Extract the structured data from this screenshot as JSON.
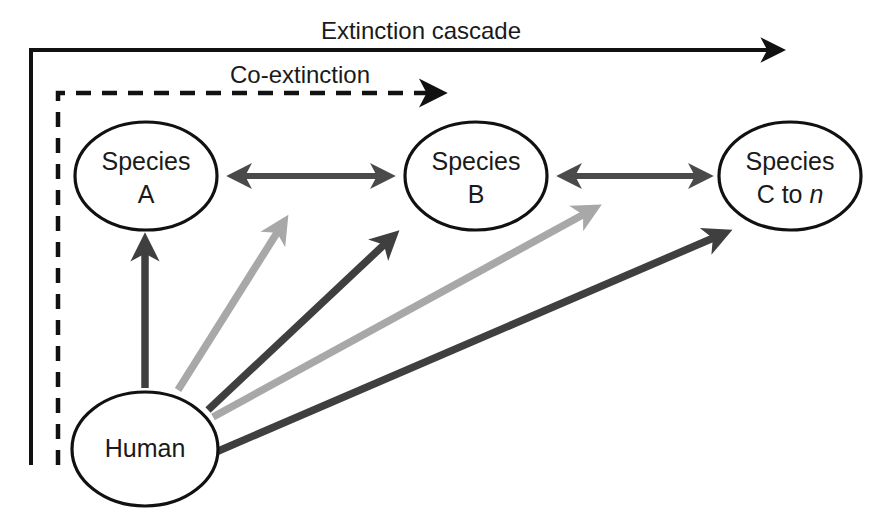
{
  "figure": {
    "type": "conceptual-flow-diagram",
    "title_visible": false,
    "background_color": "#ffffff"
  },
  "flow_labels": {
    "cascade": "Extinction cascade",
    "coextinction": "Co-extinction"
  },
  "nodes": [
    {
      "id": "species-a",
      "line1": "Species",
      "line2": "A",
      "line2_italic_part": ""
    },
    {
      "id": "species-b",
      "line1": "Species",
      "line2": "B",
      "line2_italic_part": ""
    },
    {
      "id": "species-c",
      "line1": "Species",
      "line2_prefix": "C to ",
      "line2_italic": "n"
    },
    {
      "id": "human",
      "line1": "Human",
      "line2": ""
    }
  ],
  "colors": {
    "outline": "#111111",
    "node_fill": "#ffffff",
    "arrow_dark": "#3f3f3f",
    "arrow_light": "#a8a8a8",
    "interaction_arrow": "#4a4a4a",
    "text": "#1a1a1a"
  },
  "connections": [
    {
      "id": "a-b-interaction",
      "from": "species-a",
      "to": "species-b",
      "style": "double-headed",
      "shade": "dark"
    },
    {
      "id": "b-c-interaction",
      "from": "species-b",
      "to": "species-c",
      "style": "double-headed",
      "shade": "dark"
    },
    {
      "id": "human-a-impact",
      "from": "human",
      "to": "species-a",
      "style": "single-headed",
      "shade": "dark"
    },
    {
      "id": "human-b-impact-light",
      "from": "human",
      "to": "species-b",
      "style": "single-headed",
      "shade": "light"
    },
    {
      "id": "human-b-impact-dark",
      "from": "human",
      "to": "species-b",
      "style": "single-headed",
      "shade": "dark"
    },
    {
      "id": "human-c-impact-light",
      "from": "human",
      "to": "species-c",
      "style": "single-headed",
      "shade": "light"
    },
    {
      "id": "human-c-impact-dark",
      "from": "human",
      "to": "species-c",
      "style": "single-headed",
      "shade": "dark"
    },
    {
      "id": "cascade-bracket",
      "from": "human",
      "to": "species-c",
      "style": "solid-bracket-arrow",
      "shade": "black"
    },
    {
      "id": "coextinction-bracket",
      "from": "human",
      "to": "species-b",
      "style": "dashed-bracket-arrow",
      "shade": "black"
    }
  ]
}
